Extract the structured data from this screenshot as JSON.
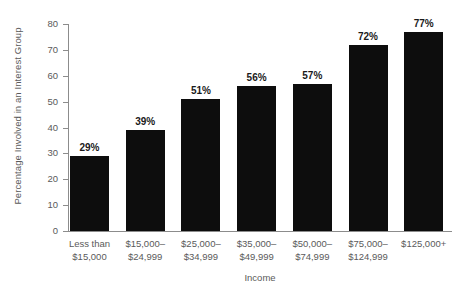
{
  "chart_data": {
    "type": "bar",
    "title": "",
    "xlabel": "Income",
    "ylabel": "Percentage Involved in an Interest Group",
    "categories": [
      "Less than $15,000",
      "$15,000–$24,999",
      "$25,000–$34,999",
      "$35,000–$49,999",
      "$50,000–$74,999",
      "$75,000–$124,999",
      "$125,000+"
    ],
    "category_lines": [
      [
        "Less than",
        "$15,000"
      ],
      [
        "$15,000–",
        "$24,999"
      ],
      [
        "$25,000–",
        "$34,999"
      ],
      [
        "$35,000–",
        "$49,999"
      ],
      [
        "$50,000–",
        "$74,999"
      ],
      [
        "$75,000–",
        "$124,999"
      ],
      [
        "$125,000+",
        ""
      ]
    ],
    "values": [
      29,
      39,
      51,
      56,
      57,
      72,
      77
    ],
    "value_labels": [
      "29%",
      "39%",
      "51%",
      "56%",
      "57%",
      "72%",
      "77%"
    ],
    "ylim": [
      0,
      80
    ],
    "ytick_values": [
      0,
      10,
      20,
      30,
      40,
      50,
      60,
      70,
      80
    ],
    "ytick_labels": [
      "0",
      "10",
      "20",
      "30",
      "40",
      "50",
      "60",
      "70",
      "80"
    ],
    "grid": false,
    "legend": null,
    "bar_color": "#0d0d0d",
    "axis_color": "#8c8c8c",
    "label_color": "#5a5a5a",
    "value_label_color": "#1a1a1a"
  }
}
